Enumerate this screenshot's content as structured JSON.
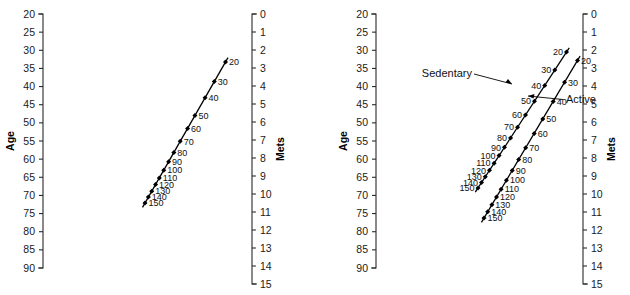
{
  "figure": {
    "type": "nomogram",
    "background": "#ffffff",
    "ink": "#000000",
    "width": 630,
    "height": 295
  },
  "chart_data": {
    "type": "line",
    "title": "",
    "subtitle": "",
    "axes": {
      "age": {
        "label": "Age",
        "ticks": [
          20,
          25,
          30,
          35,
          40,
          45,
          50,
          55,
          60,
          65,
          70,
          75,
          80,
          85,
          90
        ],
        "range": [
          20,
          90
        ],
        "step": 5,
        "position": "left",
        "tick_side": "left",
        "grid": false
      },
      "mets": {
        "label": "Mets",
        "ticks": [
          0,
          1,
          2,
          3,
          4,
          5,
          6,
          7,
          8,
          9,
          10,
          11,
          12,
          13,
          14,
          15
        ],
        "range": [
          0,
          15
        ],
        "step": 1,
        "position": "right",
        "tick_side": "left",
        "grid": false
      }
    },
    "panels": [
      {
        "name": "panel-left",
        "index": 0,
        "annotations": [],
        "series": [
          {
            "name": "nomogram-line",
            "label": "",
            "label_side": "right",
            "point_labels": [
              "20",
              "30",
              "40",
              "50",
              "60",
              "70",
              "80",
              "90",
              "100",
              "110",
              "120",
              "130",
              "140",
              "150"
            ],
            "values": [
              20,
              30,
              40,
              50,
              60,
              70,
              80,
              90,
              100,
              110,
              120,
              130,
              140,
              150
            ],
            "age_at_points": [
              33.0,
              38.3,
              42.7,
              47.5,
              51.0,
              54.5,
              57.5,
              60.0,
              62.3,
              64.4,
              66.2,
              68.0,
              69.6,
              71.2
            ],
            "mets_at_points": [
              2.6,
              3.7,
              4.4,
              5.2,
              5.9,
              6.6,
              7.3,
              7.9,
              8.4,
              8.8,
              9.3,
              9.7,
              10.1,
              10.4
            ]
          }
        ]
      },
      {
        "name": "panel-right",
        "index": 1,
        "annotations": [
          {
            "name": "sedentary-annotation",
            "text": "Sedentary",
            "points_to": "sedentary-line"
          },
          {
            "name": "active-annotation",
            "text": "Active",
            "points_to": "active-line"
          }
        ],
        "series": [
          {
            "name": "sedentary-line",
            "label": "Sedentary",
            "label_side": "left",
            "point_labels": [
              "20",
              "30",
              "40",
              "50",
              "60",
              "70",
              "80",
              "90",
              "100",
              "110",
              "120",
              "130",
              "140",
              "150"
            ],
            "values": [
              20,
              30,
              40,
              50,
              60,
              70,
              80,
              90,
              100,
              110,
              120,
              130,
              140,
              150
            ],
            "age_at_points": [
              30.5,
              35.5,
              39.8,
              44.2,
              48.0,
              51.4,
              54.4,
              57.0,
              59.3,
              61.4,
              63.4,
              65.2,
              66.8,
              68.3
            ],
            "mets_at_points": [
              2.0,
              3.0,
              3.8,
              4.6,
              5.4,
              6.1,
              6.7,
              7.2,
              7.7,
              8.1,
              8.5,
              8.9,
              9.2,
              9.5
            ]
          },
          {
            "name": "active-line",
            "label": "Active",
            "label_side": "right",
            "point_labels": [
              "20",
              "30",
              "40",
              "50",
              "60",
              "70",
              "80",
              "90",
              "100",
              "110",
              "120",
              "130",
              "140",
              "150"
            ],
            "values": [
              20,
              30,
              40,
              50,
              60,
              70,
              80,
              90,
              100,
              110,
              120,
              130,
              140,
              150
            ],
            "age_at_points": [
              32.8,
              38.4,
              43.3,
              47.8,
              51.5,
              55.2,
              58.2,
              61.0,
              63.5,
              65.8,
              67.8,
              69.8,
              71.6,
              73.2
            ],
            "mets_at_points": [
              2.6,
              3.7,
              4.6,
              5.4,
              6.1,
              6.8,
              7.4,
              8.0,
              8.5,
              8.9,
              9.4,
              9.8,
              10.2,
              10.6
            ]
          }
        ]
      }
    ]
  },
  "panels": [
    {
      "name": "panel-left",
      "age_axis_title": "Age",
      "mets_axis_title": "Mets",
      "age_ticks": [
        "20",
        "25",
        "30",
        "35",
        "40",
        "45",
        "50",
        "55",
        "60",
        "65",
        "70",
        "75",
        "80",
        "85",
        "90"
      ],
      "mets_ticks": [
        "0",
        "1",
        "2",
        "3",
        "4",
        "5",
        "6",
        "7",
        "8",
        "9",
        "10",
        "11",
        "12",
        "13",
        "14",
        "15"
      ],
      "lines": [
        {
          "name": "nomogram-line",
          "labels": [
            "20",
            "30",
            "40",
            "50",
            "60",
            "70",
            "80",
            "90",
            "100",
            "110",
            "120",
            "130",
            "140",
            "150"
          ]
        }
      ]
    },
    {
      "name": "panel-right",
      "age_axis_title": "Age",
      "mets_axis_title": "Mets",
      "age_ticks": [
        "20",
        "25",
        "30",
        "35",
        "40",
        "45",
        "50",
        "55",
        "60",
        "65",
        "70",
        "75",
        "80",
        "85",
        "90"
      ],
      "mets_ticks": [
        "0",
        "1",
        "2",
        "3",
        "4",
        "5",
        "6",
        "7",
        "8",
        "9",
        "10",
        "11",
        "12",
        "13",
        "14",
        "15"
      ],
      "annotation_sedentary": "Sedentary",
      "annotation_active": "Active",
      "lines": [
        {
          "name": "sedentary-line",
          "labels": [
            "20",
            "30",
            "40",
            "50",
            "60",
            "70",
            "80",
            "90",
            "100",
            "110",
            "120",
            "130",
            "140",
            "150"
          ]
        },
        {
          "name": "active-line",
          "labels": [
            "20",
            "30",
            "40",
            "50",
            "60",
            "70",
            "80",
            "90",
            "100",
            "110",
            "120",
            "130",
            "140",
            "150"
          ]
        }
      ]
    }
  ]
}
